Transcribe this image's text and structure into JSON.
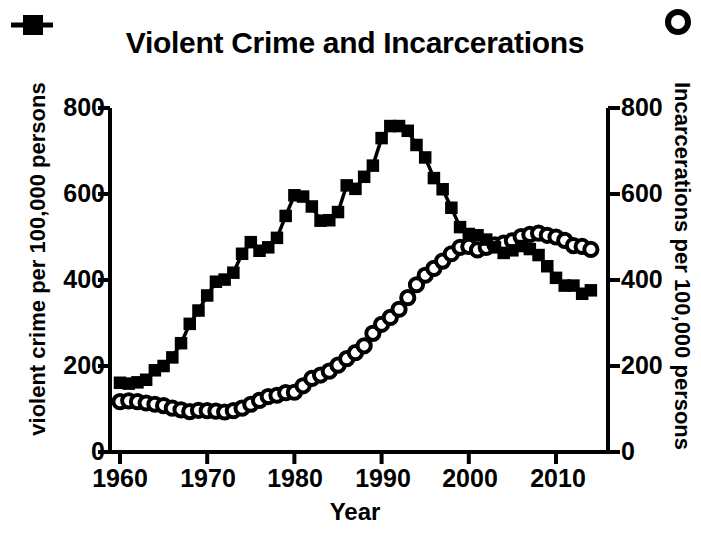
{
  "chart_data": {
    "type": "line",
    "title": "Violent Crime and Incarcerations",
    "xlabel": "Year",
    "ylabel": "violent crime per 100,000 persons",
    "y2label": "Incarcerations per 100,000 persons",
    "xlim": [
      1959,
      2016
    ],
    "ylim": [
      0,
      800
    ],
    "y2lim": [
      0,
      800
    ],
    "grid": false,
    "legend_position": "outside-top-corners",
    "x_ticks": [
      "1960",
      "1970",
      "1980",
      "1990",
      "2000",
      "2010"
    ],
    "x_tick_values": [
      1960,
      1970,
      1980,
      1990,
      2000,
      2010
    ],
    "y_ticks": [
      "0",
      "200",
      "400",
      "600",
      "800"
    ],
    "y_tick_values": [
      0,
      200,
      400,
      600,
      800
    ],
    "y2_ticks": [
      "0",
      "200",
      "400",
      "600",
      "800"
    ],
    "y2_tick_values": [
      0,
      200,
      400,
      600,
      800
    ],
    "x": [
      1960,
      1961,
      1962,
      1963,
      1964,
      1965,
      1966,
      1967,
      1968,
      1969,
      1970,
      1971,
      1972,
      1973,
      1974,
      1975,
      1976,
      1977,
      1978,
      1979,
      1980,
      1981,
      1982,
      1983,
      1984,
      1985,
      1986,
      1987,
      1988,
      1989,
      1990,
      1991,
      1992,
      1993,
      1994,
      1995,
      1996,
      1997,
      1998,
      1999,
      2000,
      2001,
      2002,
      2003,
      2004,
      2005,
      2006,
      2007,
      2008,
      2009,
      2010,
      2011,
      2012,
      2013,
      2014
    ],
    "series": [
      {
        "name": "violent crime per 100,000 persons",
        "marker": "filled-square",
        "axis": "left",
        "values": [
          161,
          159,
          162,
          168,
          190,
          200,
          220,
          253,
          298,
          329,
          364,
          396,
          401,
          417,
          461,
          488,
          468,
          476,
          498,
          549,
          597,
          594,
          571,
          538,
          539,
          558,
          620,
          612,
          640,
          666,
          730,
          758,
          758,
          747,
          714,
          685,
          637,
          611,
          568,
          523,
          507,
          504,
          494,
          476,
          463,
          469,
          479,
          472,
          458,
          432,
          405,
          387,
          387,
          368,
          376
        ]
      },
      {
        "name": "Incarcerations per 100,000 persons",
        "marker": "open-circle",
        "axis": "right",
        "values": [
          117,
          119,
          117,
          114,
          111,
          108,
          102,
          98,
          94,
          97,
          96,
          95,
          93,
          96,
          102,
          111,
          120,
          129,
          132,
          138,
          139,
          154,
          171,
          179,
          188,
          202,
          217,
          231,
          247,
          276,
          297,
          313,
          332,
          359,
          389,
          411,
          427,
          444,
          461,
          476,
          478,
          470,
          476,
          482,
          486,
          491,
          501,
          506,
          509,
          504,
          500,
          492,
          480,
          478,
          471
        ]
      }
    ]
  },
  "title": "Violent Crime and Incarcerations",
  "axes": {
    "left_title": "violent crime per 100,000 persons",
    "right_title": "Incarcerations per 100,000 persons",
    "x_title": "Year"
  },
  "ticks": {
    "y_left": [
      "800",
      "600",
      "400",
      "200",
      "0"
    ],
    "y_right": [
      "800",
      "600",
      "400",
      "200",
      "0"
    ],
    "x": [
      "1960",
      "1970",
      "1980",
      "1990",
      "2000",
      "2010"
    ]
  },
  "legend": {
    "crime_marker": "filled-square-marker",
    "incarceration_marker": "open-circle-marker"
  }
}
